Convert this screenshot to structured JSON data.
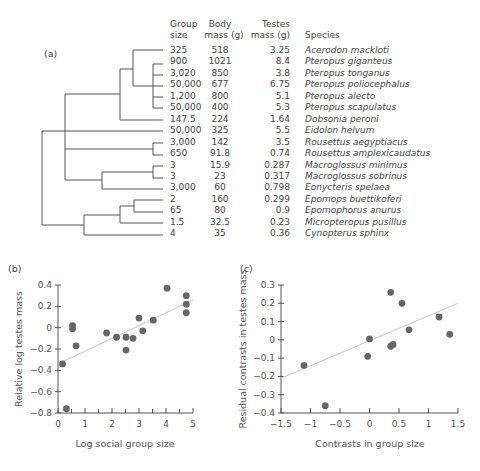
{
  "panel_labels": {
    "a": "(a)",
    "b": "(b)",
    "c": "(c)"
  },
  "table": {
    "headers": [
      {
        "line1": "Group",
        "line2": "size"
      },
      {
        "line1": "Body",
        "line2": "mass (g)"
      },
      {
        "line1": "Testes",
        "line2": "mass (g)"
      },
      {
        "line1": "",
        "line2": "Species"
      }
    ],
    "rows": [
      {
        "group_size": "325",
        "body_mass": "518",
        "testes_mass": "3.25",
        "species": "Acerodon mackloti"
      },
      {
        "group_size": "900",
        "body_mass": "1021",
        "testes_mass": "8.4",
        "species": "Pteropus giganteus"
      },
      {
        "group_size": "3,020",
        "body_mass": "850",
        "testes_mass": "3.8",
        "species": "Pteropus tonganus"
      },
      {
        "group_size": "50,000",
        "body_mass": "677",
        "testes_mass": "6.75",
        "species": "Pteropus poliocephalus"
      },
      {
        "group_size": "1,200",
        "body_mass": "800",
        "testes_mass": "5.1",
        "species": "Pteropus alecto"
      },
      {
        "group_size": "50,000",
        "body_mass": "400",
        "testes_mass": "5.3",
        "species": "Pteropus scapulatus"
      },
      {
        "group_size": "147.5",
        "body_mass": "224",
        "testes_mass": "1.64",
        "species": "Dobsonia peroni"
      },
      {
        "group_size": "50,000",
        "body_mass": "325",
        "testes_mass": "5.5",
        "species": "Eidolon helvum"
      },
      {
        "group_size": "3,000",
        "body_mass": "142",
        "testes_mass": "3.5",
        "species": "Rousettus aegyptiacus"
      },
      {
        "group_size": "650",
        "body_mass": "91.8",
        "testes_mass": "0.74",
        "species": "Rousettus amplexicaudatus"
      },
      {
        "group_size": "3",
        "body_mass": "15.9",
        "testes_mass": "0.287",
        "species": "Macroglossus minimus"
      },
      {
        "group_size": "3",
        "body_mass": "23",
        "testes_mass": "0.317",
        "species": "Macroglossus sobrinus"
      },
      {
        "group_size": "3,000",
        "body_mass": "60",
        "testes_mass": "0.798",
        "species": "Eonycteris spelaea"
      },
      {
        "group_size": "2",
        "body_mass": "160",
        "testes_mass": "0.299",
        "species": "Epomops buettikoferi"
      },
      {
        "group_size": "65",
        "body_mass": "80",
        "testes_mass": "0.9",
        "species": "Epomophorus anurus"
      },
      {
        "group_size": "1.5",
        "body_mass": "32.5",
        "testes_mass": "0.23",
        "species": "Micropteropus pusillus"
      },
      {
        "group_size": "4",
        "body_mass": "35",
        "testes_mass": "0.36",
        "species": "Cynopterus sphinx"
      }
    ]
  },
  "colors": {
    "ink": "#444444",
    "point": "#666666",
    "trend": "#cccccc",
    "axis": "#555555"
  },
  "chart_data": [
    {
      "panel": "b",
      "type": "scatter",
      "title": "",
      "xlabel": "Log social group size",
      "ylabel": "Relative log testes mass",
      "xlim": [
        0,
        5
      ],
      "ylim": [
        -0.8,
        0.4
      ],
      "xticks": [
        "0",
        "1",
        "2",
        "3",
        "4",
        "5"
      ],
      "yticks": [
        "0.4",
        "0.2",
        "0",
        "-0.2",
        "-0.4",
        "-0.6",
        "-0.8"
      ],
      "grid": false,
      "points": [
        [
          0.17,
          -0.34
        ],
        [
          0.31,
          -0.76
        ],
        [
          0.54,
          0.02
        ],
        [
          0.54,
          -0.01
        ],
        [
          0.67,
          -0.17
        ],
        [
          1.8,
          -0.05
        ],
        [
          2.17,
          -0.09
        ],
        [
          2.52,
          -0.09
        ],
        [
          2.52,
          -0.21
        ],
        [
          2.78,
          -0.1
        ],
        [
          3.0,
          0.09
        ],
        [
          3.14,
          -0.03
        ],
        [
          3.53,
          0.07
        ],
        [
          4.04,
          0.37
        ],
        [
          4.75,
          0.3
        ],
        [
          4.75,
          0.22
        ],
        [
          4.75,
          0.14
        ]
      ],
      "trendline": [
        [
          0.17,
          -0.32
        ],
        [
          5.0,
          0.26
        ]
      ]
    },
    {
      "panel": "c",
      "type": "scatter",
      "title": "",
      "xlabel": "Contrasts in group size",
      "ylabel": "Residual contrasts in testes mass",
      "xlim": [
        -1.5,
        1.5
      ],
      "ylim": [
        -0.4,
        0.3
      ],
      "xticks": [
        "-1.5",
        "-1",
        "-0.5",
        "0",
        "0.5",
        "1",
        "1.5"
      ],
      "yticks": [
        "0.3",
        "0.2",
        "0.1",
        "0",
        "-0.1",
        "-0.2",
        "-0.3",
        "-0.4"
      ],
      "grid": false,
      "points": [
        [
          -1.11,
          -0.14
        ],
        [
          -0.75,
          -0.36
        ],
        [
          -0.03,
          -0.09
        ],
        [
          0.0,
          0.005
        ],
        [
          0.36,
          -0.035
        ],
        [
          0.4,
          -0.025
        ],
        [
          0.36,
          0.26
        ],
        [
          0.55,
          0.2
        ],
        [
          0.67,
          0.055
        ],
        [
          1.18,
          0.125
        ],
        [
          1.36,
          0.03
        ]
      ],
      "trendline": [
        [
          -1.5,
          -0.21
        ],
        [
          1.5,
          0.2
        ]
      ]
    }
  ]
}
